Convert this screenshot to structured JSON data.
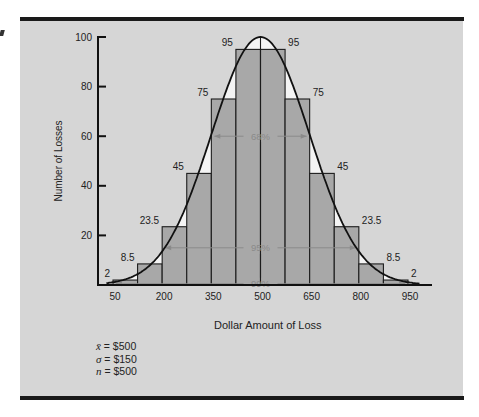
{
  "chart_data": {
    "type": "bar",
    "title": "",
    "xlabel": "Dollar Amount of Loss",
    "ylabel": "Number of Losses",
    "ylim": [
      0,
      100
    ],
    "yticks": [
      20,
      40,
      60,
      80,
      100
    ],
    "xtick_labels": [
      "50",
      "200",
      "350",
      "500",
      "650",
      "800",
      "950"
    ],
    "bins": [
      {
        "lo": 50,
        "hi": 125,
        "value": 2
      },
      {
        "lo": 125,
        "hi": 200,
        "value": 8.5
      },
      {
        "lo": 200,
        "hi": 275,
        "value": 23.5
      },
      {
        "lo": 275,
        "hi": 350,
        "value": 45
      },
      {
        "lo": 350,
        "hi": 425,
        "value": 75
      },
      {
        "lo": 425,
        "hi": 500,
        "value": 95
      },
      {
        "lo": 500,
        "hi": 575,
        "value": 95
      },
      {
        "lo": 575,
        "hi": 650,
        "value": 75
      },
      {
        "lo": 650,
        "hi": 725,
        "value": 45
      },
      {
        "lo": 725,
        "hi": 800,
        "value": 23.5
      },
      {
        "lo": 800,
        "hi": 875,
        "value": 8.5
      },
      {
        "lo": 875,
        "hi": 950,
        "value": 2
      }
    ],
    "categories": [
      "50-125",
      "125-200",
      "200-275",
      "275-350",
      "350-425",
      "425-500",
      "500-575",
      "575-650",
      "650-725",
      "725-800",
      "800-875",
      "875-950"
    ],
    "values": [
      2,
      8.5,
      23.5,
      45,
      75,
      95,
      95,
      75,
      45,
      23.5,
      8.5,
      2
    ],
    "bar_labels": [
      "2",
      "8.5",
      "23.5",
      "45",
      "75",
      "95",
      "95",
      "75",
      "45",
      "23.5",
      "8.5",
      "2"
    ],
    "overlay": "normal curve",
    "annotations": [
      {
        "label": "68%",
        "from": 350,
        "to": 650,
        "y": 60
      },
      {
        "label": "95%",
        "from": 200,
        "to": 800,
        "y": 15
      },
      {
        "label": "99%",
        "from": 50,
        "to": 950,
        "y": 0.5
      }
    ],
    "stats": {
      "mean": "$500",
      "sigma": "$150",
      "n": "$500"
    },
    "grid": false,
    "legend": null
  },
  "labels": {
    "xlabel": "Dollar Amount of Loss",
    "ylabel": "Number of Losses",
    "stat_mean_sym": "x̄",
    "stat_mean_val": " = $500",
    "stat_sigma_sym": "σ",
    "stat_sigma_val": " = $150",
    "stat_n_sym": "n",
    "stat_n_val": " = $500"
  },
  "colors": {
    "panel": "#d6d6d6",
    "bar_fill": "#a8a8a8",
    "bar_stroke": "#1c1c1c",
    "curve": "#111111",
    "under_curve": "#f4f4f4",
    "annotation": "#8a8a8a"
  }
}
